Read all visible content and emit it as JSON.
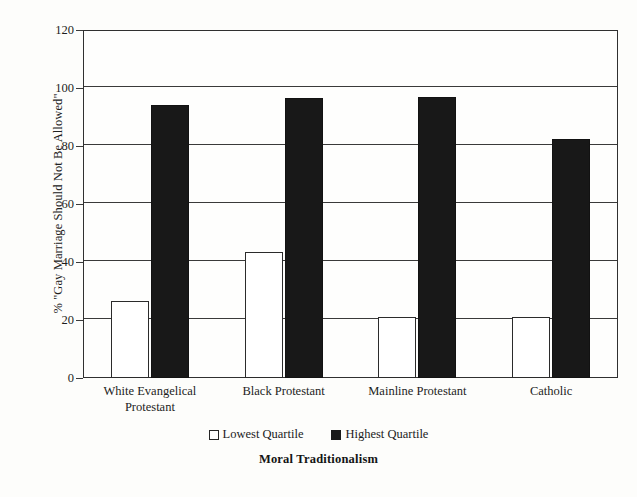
{
  "chart_data": {
    "type": "bar",
    "title": "",
    "xlabel": "Moral Traditionalism",
    "ylabel": "% \"Gay Marriage Should Not Be Allowed\"",
    "categories": [
      "White Evangelical Protestant",
      "Black Protestant",
      "Mainline Protestant",
      "Catholic"
    ],
    "series": [
      {
        "name": "Lowest Quartile",
        "values": [
          26.5,
          43.5,
          21,
          21
        ],
        "color": "#ffffff"
      },
      {
        "name": "Highest Quartile",
        "values": [
          94,
          96.5,
          97,
          82.5
        ],
        "color": "#181818"
      }
    ],
    "ylim": [
      0,
      120
    ],
    "yticks": [
      0,
      20,
      40,
      60,
      80,
      100,
      120
    ],
    "grid": true,
    "legend_position": "bottom"
  },
  "axis": {
    "y_title": "% \"Gay Marriage Should Not Be Allowed\"",
    "x_title": "Moral Traditionalism",
    "y_tick_labels": [
      "120",
      "100",
      "80",
      "60",
      "40",
      "20",
      "0"
    ]
  },
  "categories": [
    {
      "line1": "White Evangelical",
      "line2": "Protestant"
    },
    {
      "line1": "Black Protestant",
      "line2": ""
    },
    {
      "line1": "Mainline Protestant",
      "line2": ""
    },
    {
      "line1": "Catholic",
      "line2": ""
    }
  ],
  "legend": {
    "items": [
      {
        "label": "Lowest Quartile",
        "swatch": "hollow-square"
      },
      {
        "label": "Highest Quartile",
        "swatch": "filled-square"
      }
    ]
  }
}
